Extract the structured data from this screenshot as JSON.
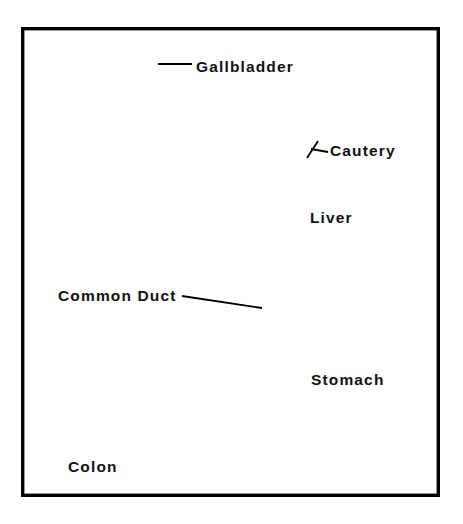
{
  "figure": {
    "kind": "medical-line-illustration",
    "background_color": "#ffffff",
    "ink_color": "#000000",
    "frame": {
      "x": 21,
      "y": 27,
      "width": 419,
      "height": 470,
      "stroke_color": "#000000"
    }
  },
  "labels": [
    {
      "id": "gallbladder",
      "text": "Gallbladder",
      "x": 196,
      "y": 72,
      "has_leader": true
    },
    {
      "id": "cautery",
      "text": "Cautery",
      "x": 330,
      "y": 156,
      "has_leader": true
    },
    {
      "id": "liver",
      "text": "Liver",
      "x": 310,
      "y": 223,
      "has_leader": false
    },
    {
      "id": "common-duct",
      "text": "Common Duct",
      "x": 58,
      "y": 301,
      "has_leader": true
    },
    {
      "id": "stomach",
      "text": "Stomach",
      "x": 311,
      "y": 385,
      "has_leader": false
    },
    {
      "id": "colon",
      "text": "Colon",
      "x": 68,
      "y": 472,
      "has_leader": false
    }
  ],
  "leaders": [
    {
      "id": "gallbladder-leader",
      "d": "M 158 64 L 192 64"
    },
    {
      "id": "cautery-leader",
      "d": "M 311 146 L 327 151"
    },
    {
      "id": "cautery-leader-tick",
      "d": "M 318 140 L 308 155"
    },
    {
      "id": "common-duct-leader",
      "d": "M 182 296 L 258 307"
    }
  ],
  "anatomy": [
    {
      "id": "liver",
      "name": "Liver"
    },
    {
      "id": "gallbladder",
      "name": "Gallbladder"
    },
    {
      "id": "common-duct",
      "name": "Common Duct"
    },
    {
      "id": "stomach",
      "name": "Stomach"
    },
    {
      "id": "colon",
      "name": "Colon"
    },
    {
      "id": "cautery-instrument",
      "name": "Cautery"
    }
  ]
}
